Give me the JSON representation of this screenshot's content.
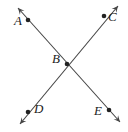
{
  "diagram": {
    "type": "intersecting-lines",
    "lines": [
      {
        "name": "line-AE",
        "from": [
          18,
          8
        ],
        "to": [
          120,
          122
        ],
        "arrows": "both"
      },
      {
        "name": "line-CD",
        "from": [
          118,
          6
        ],
        "to": [
          20,
          124
        ],
        "arrows": "both"
      }
    ],
    "points": [
      {
        "label": "A",
        "x": 28,
        "y": 20,
        "lx": 14,
        "ly": 20
      },
      {
        "label": "C",
        "x": 104,
        "y": 16,
        "lx": 108,
        "ly": 16
      },
      {
        "label": "B",
        "x": 67,
        "y": 64,
        "lx": 52,
        "ly": 58
      },
      {
        "label": "D",
        "x": 28,
        "y": 112,
        "lx": 34,
        "ly": 108
      },
      {
        "label": "E",
        "x": 109,
        "y": 110,
        "lx": 94,
        "ly": 110
      }
    ],
    "colors": {
      "line": "#444444",
      "point": "#222222"
    }
  }
}
